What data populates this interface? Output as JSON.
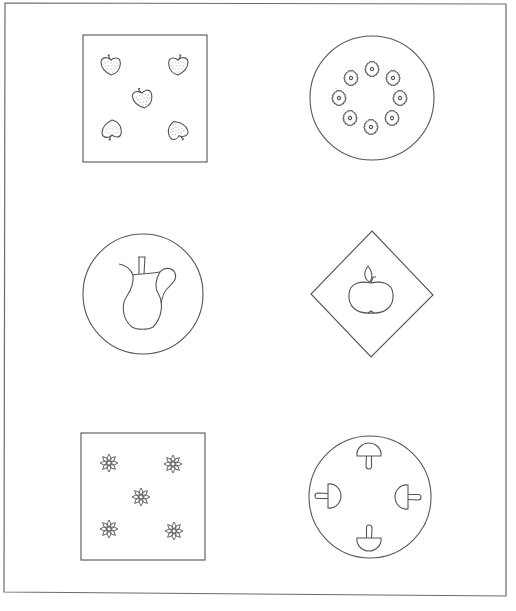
{
  "page": {
    "title": "Pattern plates worksheet",
    "frame_color": "#6b6b6b",
    "line_color": "#555555",
    "background": "#ffffff"
  },
  "panels": [
    {
      "id": "strawberry-square",
      "shape": "square",
      "motif": "strawberry",
      "count": 5,
      "arrangement": "quincunx (four corners + center)"
    },
    {
      "id": "flower-ring-circle",
      "shape": "circle",
      "motif": "round flower",
      "count": 8,
      "arrangement": "ring"
    },
    {
      "id": "jug-circle",
      "shape": "circle",
      "motif": "jug / pitcher",
      "count": 1,
      "arrangement": "center"
    },
    {
      "id": "apple-diamond",
      "shape": "diamond",
      "motif": "apple",
      "count": 1,
      "arrangement": "center"
    },
    {
      "id": "star-flower-square",
      "shape": "square",
      "motif": "star flower",
      "count": 5,
      "arrangement": "quincunx (four corners + center)"
    },
    {
      "id": "mushroom-circle",
      "shape": "circle",
      "motif": "mushroom",
      "count": 4,
      "arrangement": "cross, pointing inward"
    }
  ]
}
